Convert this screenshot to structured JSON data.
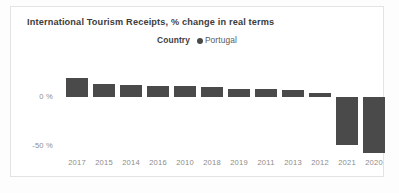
{
  "chart_data": {
    "type": "bar",
    "title": "International Tourism Receipts, % change in real terms",
    "legend": {
      "title": "Country",
      "entries": [
        {
          "label": "Portugal",
          "color": "#4a4a4a",
          "marker": "circle-marker-icon"
        }
      ],
      "position": "top-center"
    },
    "categories": [
      "2017",
      "2015",
      "2014",
      "2016",
      "2010",
      "2018",
      "2019",
      "2011",
      "2013",
      "2012",
      "2021",
      "2020"
    ],
    "series": [
      {
        "name": "Portugal",
        "values": [
          19,
          13,
          12.5,
          11.5,
          11,
          10.5,
          8.5,
          8,
          7,
          4,
          -49,
          -57
        ]
      }
    ],
    "xlabel": "",
    "ylabel": "",
    "ylim": [
      -60,
      22
    ],
    "yticks": [
      0,
      -50
    ],
    "ytick_labels": [
      "0 %",
      "-50 %"
    ],
    "grid": false,
    "bar_color": "#4a4a4a",
    "background_color": "#ffffff"
  }
}
